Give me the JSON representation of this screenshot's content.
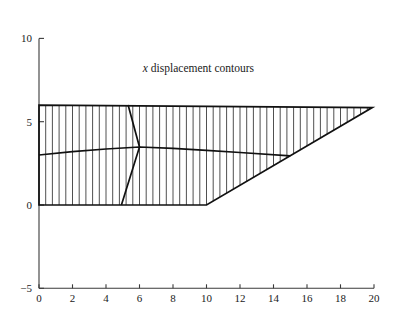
{
  "figure": {
    "title": "x displacement contours",
    "title_italic_prefix": "x",
    "title_rest": " displacement contours",
    "title_x": 6.2,
    "title_y": 8.0,
    "background": "#ffffff",
    "line_color": "#111111",
    "hatch_color": "#3c3c3c",
    "axis_color": "#3a3a3a"
  },
  "chart_data": {
    "type": "line",
    "title": "x displacement contours",
    "xlabel": "",
    "ylabel": "",
    "xlim": [
      0,
      20
    ],
    "ylim": [
      -5,
      10
    ],
    "xticks": [
      0,
      2,
      4,
      6,
      8,
      10,
      12,
      14,
      16,
      18,
      20
    ],
    "yticks": [
      -5,
      0,
      5,
      10
    ],
    "xtick_labels": [
      "0",
      "2",
      "4",
      "6",
      "8",
      "10",
      "12",
      "14",
      "16",
      "18",
      "20"
    ],
    "ytick_labels": [
      "-5",
      "0",
      "5",
      "10"
    ],
    "grid": false,
    "legend": false,
    "mesh_region": {
      "name": "wedge-domain",
      "vertices": [
        [
          0,
          6
        ],
        [
          19.9,
          5.85
        ],
        [
          10,
          0
        ],
        [
          0,
          0
        ]
      ],
      "hatch": {
        "orientation": "vertical",
        "spacing": 0.4,
        "start_x": 0.4,
        "end_x": 19.6
      }
    },
    "series": [
      {
        "name": "contour-v-shape",
        "points": [
          [
            5.32,
            6.0
          ],
          [
            6.0,
            3.48
          ],
          [
            4.92,
            0.0
          ]
        ]
      },
      {
        "name": "contour-horizontal",
        "points": [
          [
            0.0,
            3.0
          ],
          [
            2.0,
            3.2
          ],
          [
            4.0,
            3.36
          ],
          [
            6.0,
            3.48
          ],
          [
            8.0,
            3.4
          ],
          [
            10.0,
            3.28
          ],
          [
            12.0,
            3.15
          ],
          [
            15.0,
            2.95
          ]
        ]
      }
    ]
  }
}
